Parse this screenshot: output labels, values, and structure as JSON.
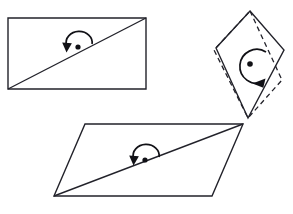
{
  "figure": {
    "background_color": "#ffffff",
    "stroke_color": "#22222a",
    "accent_color": "#111116",
    "canvas": {
      "width": 293,
      "height": 214
    },
    "shapes": [
      {
        "id": "rectangle",
        "label": "rectangle-with-diagonal",
        "kind": "rectangle",
        "style": "solid",
        "points": "8,18 146,18 146,89 8,89",
        "diagonal": {
          "x1": 8,
          "y1": 89,
          "x2": 146,
          "y2": 18
        },
        "center": {
          "x": 78,
          "y": 47
        },
        "rotation_marker": {
          "type": "half-turn-arc",
          "direction": "counterclockwise",
          "arc_path": "M 92 44 A 13 11 0 1 0 66.5 45",
          "arrow_points": "66.5,52.5 62.2,42.4 71.9,43.2",
          "arc_radius": 13
        }
      },
      {
        "id": "kite",
        "label": "kite-pair-solid-and-dashed",
        "kind": "kite",
        "style": "solid",
        "points": "250,11 284,50 248,118 216,48",
        "center": {
          "x": 250,
          "y": 64
        },
        "rotation_marker": {
          "type": "full-turn-arc",
          "direction": "clockwise",
          "arc_path": "M 266 52 A 17 17 0 1 0 263.5 82",
          "arrow_points": "265.5,78.5 252.5,83.5 263.3,87.8",
          "arc_radius": 17
        }
      },
      {
        "id": "kite-dashed",
        "label": "kite-dashed-rotated-copy",
        "kind": "kite",
        "style": "dashed",
        "points": "250,11 282,80 248,118 214,50",
        "center": {
          "x": 250,
          "y": 64
        }
      },
      {
        "id": "parallelogram",
        "label": "parallelogram-with-diagonal",
        "kind": "parallelogram",
        "style": "solid",
        "points": "85,124 243,124 212,196 54,196",
        "diagonal": {
          "x1": 54,
          "y1": 196,
          "x2": 243,
          "y2": 124
        },
        "center": {
          "x": 145,
          "y": 160
        },
        "rotation_marker": {
          "type": "half-turn-arc",
          "direction": "counterclockwise",
          "arc_path": "M 159 157 A 13 11 0 1 0 133.5 158",
          "arrow_points": "133.5,165.5 129.2,155.4 138.9,156.2",
          "arc_radius": 13
        }
      }
    ]
  }
}
